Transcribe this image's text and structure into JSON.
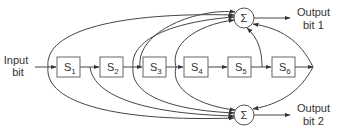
{
  "diagram": {
    "type": "convolutional-encoder",
    "input_label_line1": "Input",
    "input_label_line2": "bit",
    "registers": [
      {
        "name": "S",
        "sub": "1"
      },
      {
        "name": "S",
        "sub": "2"
      },
      {
        "name": "S",
        "sub": "3"
      },
      {
        "name": "S",
        "sub": "4"
      },
      {
        "name": "S",
        "sub": "5"
      },
      {
        "name": "S",
        "sub": "6"
      }
    ],
    "sum_symbol": "Σ",
    "outputs": [
      {
        "line1": "Output",
        "line2": "bit 1"
      },
      {
        "line1": "Output",
        "line2": "bit 2"
      }
    ],
    "colors": {
      "line": "#444444",
      "box": "#666666",
      "text": "#333333"
    }
  }
}
